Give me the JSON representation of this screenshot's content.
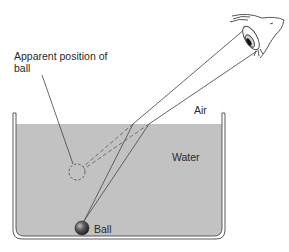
{
  "diagram": {
    "labels": {
      "apparent_position": "Apparent position of ball",
      "air": "Air",
      "water": "Water",
      "ball": "Ball"
    },
    "colors": {
      "water": "#c2c2c2",
      "tank_outline": "#5a5a5a",
      "ray": "#555555",
      "ball": "#3a3a3a",
      "text": "#2a2a2a"
    },
    "icons": {
      "eye": "eye-icon",
      "ball": "ball-icon",
      "apparent_ball": "dashed-circle-icon"
    }
  }
}
